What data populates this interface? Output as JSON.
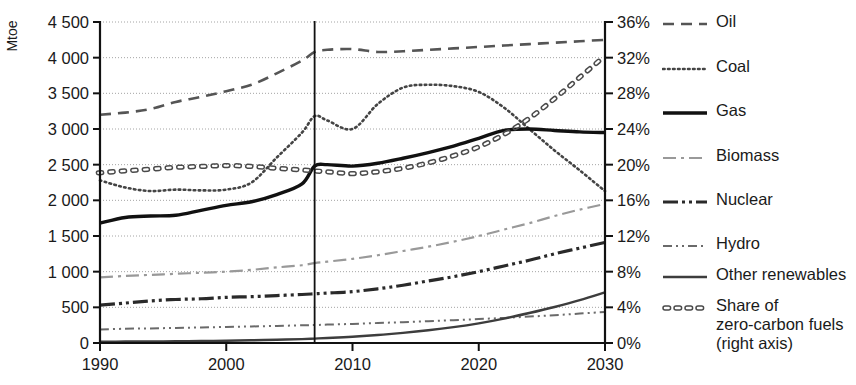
{
  "chart_data": {
    "type": "line",
    "title": "",
    "xlabel": "",
    "ylabel": "Mtoe",
    "ylabel_right": "",
    "xlim": [
      1990,
      2030
    ],
    "ylim": [
      0,
      4500
    ],
    "ylim_right": [
      0,
      36
    ],
    "grid": true,
    "legend_position": "right",
    "x_ticks": [
      "1990",
      "2000",
      "2010",
      "2020",
      "2030"
    ],
    "x_tick_values": [
      1990,
      2000,
      2010,
      2020,
      2030
    ],
    "y_ticks": [
      "0",
      "500",
      "1 000",
      "1 500",
      "2 000",
      "2 500",
      "3 000",
      "3 500",
      "4 000",
      "4 500"
    ],
    "y_tick_values": [
      0,
      500,
      1000,
      1500,
      2000,
      2500,
      3000,
      3500,
      4000,
      4500
    ],
    "y_ticks_right": [
      "0%",
      "4%",
      "8%",
      "12%",
      "16%",
      "20%",
      "24%",
      "28%",
      "32%",
      "36%"
    ],
    "y_tick_values_right": [
      0,
      4,
      8,
      12,
      16,
      20,
      24,
      28,
      32,
      36
    ],
    "divider_x": 2007,
    "x": [
      1990,
      1992,
      1994,
      1996,
      1998,
      2000,
      2002,
      2004,
      2006,
      2007,
      2008,
      2010,
      2012,
      2014,
      2016,
      2018,
      2020,
      2022,
      2024,
      2026,
      2028,
      2030
    ],
    "series": [
      {
        "name": "Oil",
        "style": "dashed",
        "axis": "left",
        "color": "#555555",
        "values": [
          3200,
          3230,
          3280,
          3380,
          3450,
          3530,
          3620,
          3780,
          3960,
          4080,
          4110,
          4120,
          4080,
          4090,
          4110,
          4130,
          4150,
          4170,
          4190,
          4210,
          4230,
          4250
        ]
      },
      {
        "name": "Coal",
        "style": "dotted",
        "axis": "left",
        "color": "#444444",
        "values": [
          2280,
          2180,
          2130,
          2150,
          2140,
          2150,
          2250,
          2600,
          2950,
          3180,
          3120,
          3000,
          3350,
          3580,
          3620,
          3600,
          3520,
          3300,
          3000,
          2700,
          2420,
          2130
        ]
      },
      {
        "name": "Gas",
        "style": "solid",
        "axis": "left",
        "color": "#111111",
        "values": [
          1680,
          1760,
          1780,
          1790,
          1860,
          1930,
          1980,
          2080,
          2230,
          2480,
          2500,
          2480,
          2520,
          2590,
          2670,
          2760,
          2870,
          2980,
          3000,
          2980,
          2960,
          2950
        ]
      },
      {
        "name": "Biomass",
        "style": "dashdot-long",
        "axis": "left",
        "color": "#999999",
        "values": [
          920,
          940,
          955,
          970,
          985,
          1000,
          1025,
          1060,
          1090,
          1120,
          1140,
          1180,
          1230,
          1290,
          1350,
          1420,
          1500,
          1590,
          1680,
          1780,
          1870,
          1950
        ]
      },
      {
        "name": "Nuclear",
        "style": "dashdotdot",
        "axis": "left",
        "color": "#2a2a2a",
        "values": [
          530,
          560,
          590,
          610,
          620,
          640,
          650,
          665,
          680,
          690,
          700,
          720,
          760,
          810,
          870,
          930,
          1000,
          1080,
          1160,
          1250,
          1330,
          1410
        ]
      },
      {
        "name": "Hydro",
        "style": "dashdot-short",
        "axis": "left",
        "color": "#6a6a6a",
        "values": [
          190,
          200,
          205,
          212,
          218,
          225,
          232,
          240,
          248,
          252,
          258,
          268,
          280,
          292,
          305,
          320,
          335,
          352,
          370,
          390,
          412,
          435
        ]
      },
      {
        "name": "Other renewables",
        "style": "solid-thin",
        "axis": "left",
        "color": "#3d3d3d",
        "values": [
          18,
          20,
          22,
          25,
          28,
          32,
          38,
          45,
          55,
          62,
          70,
          88,
          112,
          142,
          178,
          222,
          276,
          342,
          420,
          505,
          600,
          710
        ]
      },
      {
        "name": "Share of zero-carbon fuels (right axis)",
        "short_name": "Share of zero-carbon fuels",
        "style": "open-dash",
        "axis": "right",
        "color": "#4a4a4a",
        "values": [
          19.1,
          19.3,
          19.5,
          19.7,
          19.8,
          19.9,
          19.8,
          19.6,
          19.4,
          19.3,
          19.2,
          19.0,
          19.2,
          19.6,
          20.2,
          21.0,
          22.0,
          23.4,
          25.2,
          27.4,
          29.8,
          32.2
        ]
      }
    ]
  },
  "legend": {
    "items": [
      {
        "label": "Oil",
        "style": "dashed"
      },
      {
        "label": "Coal",
        "style": "dotted"
      },
      {
        "label": "Gas",
        "style": "solid"
      },
      {
        "label": "Biomass",
        "style": "dashdot-long"
      },
      {
        "label": "Nuclear",
        "style": "dashdotdot"
      },
      {
        "label": "Hydro",
        "style": "dashdot-short"
      },
      {
        "label": "Other renewables",
        "style": "solid-thin"
      },
      {
        "label": "Share of\nzero-carbon fuels\n(right axis)",
        "style": "open-dash"
      }
    ]
  },
  "colors": {
    "axis": "#111111",
    "grid": "#9a9a9a",
    "background": "#ffffff",
    "text": "#1a1a1a"
  }
}
